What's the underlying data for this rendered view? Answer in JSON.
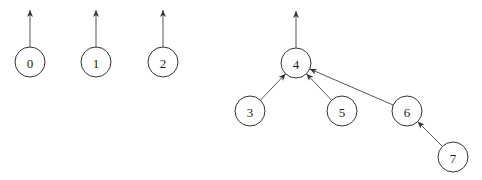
{
  "diagram": {
    "type": "forest",
    "radius": 15,
    "nodes": [
      {
        "id": "0",
        "label": "0",
        "x": 30,
        "y": 62
      },
      {
        "id": "1",
        "label": "1",
        "x": 96,
        "y": 62
      },
      {
        "id": "2",
        "label": "2",
        "x": 163,
        "y": 62
      },
      {
        "id": "4",
        "label": "4",
        "x": 296,
        "y": 63
      },
      {
        "id": "3",
        "label": "3",
        "x": 250,
        "y": 111
      },
      {
        "id": "5",
        "label": "5",
        "x": 342,
        "y": 111
      },
      {
        "id": "6",
        "label": "6",
        "x": 407,
        "y": 111
      },
      {
        "id": "7",
        "label": "7",
        "x": 453,
        "y": 157
      }
    ],
    "edges": [
      {
        "from": "3",
        "to": "4"
      },
      {
        "from": "5",
        "to": "4"
      },
      {
        "from": "6",
        "to": "4"
      },
      {
        "from": "7",
        "to": "6"
      }
    ],
    "root_arrows": [
      {
        "node": "0",
        "to_y": 10
      },
      {
        "node": "1",
        "to_y": 10
      },
      {
        "node": "2",
        "to_y": 10
      },
      {
        "node": "4",
        "to_y": 11
      }
    ]
  }
}
